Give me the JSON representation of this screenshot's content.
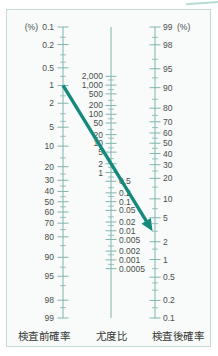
{
  "chart_data": {
    "type": "nomogram",
    "axes": {
      "left": {
        "title": "検査前確率",
        "unit": "(%)",
        "scale": "log-odds, 0.1 at top to 99 at bottom",
        "ticks": [
          0.1,
          0.2,
          0.5,
          1,
          2,
          5,
          10,
          20,
          30,
          40,
          50,
          60,
          70,
          80,
          90,
          95,
          98,
          99
        ],
        "minor_ticks": [
          0.15,
          0.3,
          0.4,
          0.7,
          1.5,
          3,
          4,
          7,
          15,
          25,
          35,
          45,
          55,
          65,
          75,
          85,
          93,
          96.5,
          98.5
        ]
      },
      "middle": {
        "title": "尤度比",
        "scale": "log, 2000 at top to 0.0005 at bottom, half pitch of outer axes",
        "ticks": [
          {
            "v": 2000,
            "label": "2,000"
          },
          {
            "v": 1000,
            "label": "1,000"
          },
          {
            "v": 500,
            "label": "500"
          },
          {
            "v": 200,
            "label": "200"
          },
          {
            "v": 100,
            "label": "100"
          },
          {
            "v": 50,
            "label": "50"
          },
          {
            "v": 20,
            "label": "20"
          },
          {
            "v": 10,
            "label": "10"
          },
          {
            "v": 5,
            "label": "5"
          },
          {
            "v": 2,
            "label": "2"
          },
          {
            "v": 1,
            "label": "1"
          },
          {
            "v": 0.5,
            "label": "0.5"
          },
          {
            "v": 0.2,
            "label": "0.2"
          },
          {
            "v": 0.1,
            "label": "0.1"
          },
          {
            "v": 0.05,
            "label": "0.05"
          },
          {
            "v": 0.02,
            "label": "0.02"
          },
          {
            "v": 0.01,
            "label": "0.01"
          },
          {
            "v": 0.005,
            "label": "0.005"
          },
          {
            "v": 0.002,
            "label": "0.002"
          },
          {
            "v": 0.001,
            "label": "0.001"
          },
          {
            "v": 0.0005,
            "label": "0.0005"
          }
        ],
        "minor_ticks": [
          1500,
          700,
          300,
          150,
          70,
          30,
          15,
          7,
          3,
          1.5,
          0.7,
          0.3,
          0.15,
          0.07,
          0.03,
          0.015,
          0.007,
          0.003,
          0.0015,
          0.0007
        ]
      },
      "right": {
        "title": "検査後確率",
        "unit": "(%)",
        "scale": "log-odds, 99 at top to 0.1 at bottom",
        "ticks": [
          99,
          98,
          95,
          90,
          80,
          70,
          60,
          50,
          40,
          30,
          20,
          10,
          5,
          2,
          1,
          0.5,
          0.2,
          0.1
        ],
        "minor_ticks": [
          98.5,
          96.5,
          93,
          85,
          75,
          65,
          55,
          45,
          35,
          25,
          15,
          7,
          4,
          3,
          1.5,
          0.7,
          0.4,
          0.3,
          0.15
        ]
      }
    },
    "example_arrow": {
      "pretest_percent": 1,
      "posttest_percent": 3,
      "description": "teal arrow drawn from 1% on pre-test axis down-right to about 3% on post-test axis"
    },
    "colors": {
      "axis": "#82b5ae",
      "tick_label": "#4a4f4c",
      "title_text": "#343835",
      "arrow": "#15897c",
      "panel_border": "#c6dad4",
      "panel_bg": "#f8fbf9",
      "accent_corner": "#b7dcd5"
    }
  }
}
